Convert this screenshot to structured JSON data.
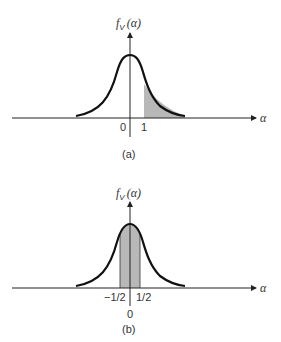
{
  "figure": {
    "panels": [
      {
        "id": "a",
        "caption": "(a)",
        "ylabel_f": "f",
        "ylabel_sub": "V",
        "ylabel_arg": "(α)",
        "xlabel": "α",
        "tick_labels": [
          "0",
          "1"
        ],
        "shaded_region": "α > 1"
      },
      {
        "id": "b",
        "caption": "(b)",
        "ylabel_f": "f",
        "ylabel_sub": "V",
        "ylabel_arg": "(α)",
        "xlabel": "α",
        "tick_labels": [
          "−1/2",
          "1/2",
          "0"
        ],
        "shaded_region": "−1/2 < α < 1/2"
      }
    ],
    "colors": {
      "curve": "#111111",
      "axis": "#222222",
      "shade": "#b8b8b8"
    }
  }
}
